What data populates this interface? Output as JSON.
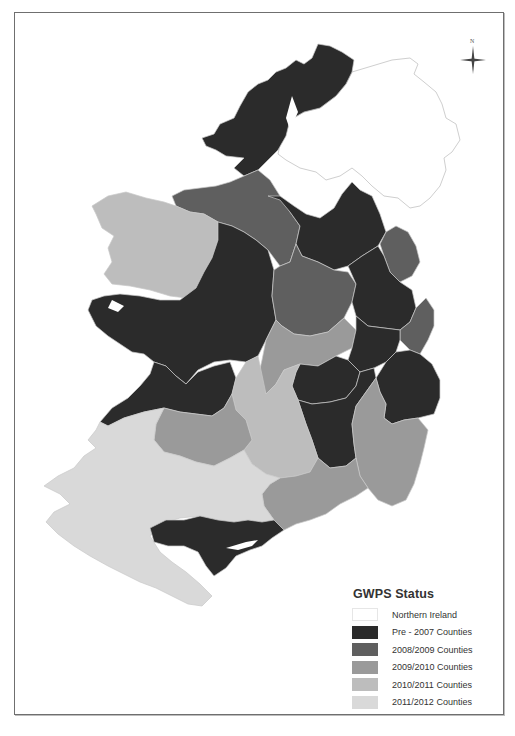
{
  "map": {
    "subject": "Ireland counties by GWPS status",
    "colors": {
      "northern_ireland": "#ffffff",
      "pre_2007": "#2b2b2b",
      "y2008_2009": "#5f5f5f",
      "y2009_2010": "#9a9a9a",
      "y2010_2011": "#bdbdbd",
      "y2011_2012": "#d9d9d9",
      "border": "#c8c8c8",
      "ni_outline": "#cfcfcf"
    }
  },
  "north_arrow": {
    "label": "N"
  },
  "legend": {
    "title": "GWPS Status",
    "items": [
      {
        "label": "Northern Ireland",
        "color": "#ffffff"
      },
      {
        "label": "Pre - 2007 Counties",
        "color": "#2b2b2b"
      },
      {
        "label": "2008/2009 Counties",
        "color": "#5f5f5f"
      },
      {
        "label": "2009/2010 Counties",
        "color": "#9a9a9a"
      },
      {
        "label": "2010/2011 Counties",
        "color": "#bdbdbd"
      },
      {
        "label": "2011/2012 Counties",
        "color": "#d9d9d9"
      }
    ]
  }
}
